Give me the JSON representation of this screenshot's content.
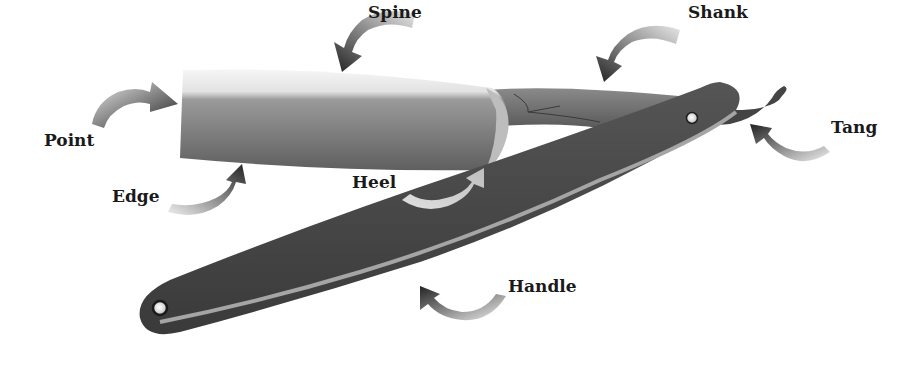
{
  "diagram": {
    "labels": [
      {
        "id": "spine",
        "text": "Spine",
        "x": 368,
        "y": 4
      },
      {
        "id": "shank",
        "text": "Shank",
        "x": 688,
        "y": 4
      },
      {
        "id": "point",
        "text": "Point",
        "x": 44,
        "y": 132
      },
      {
        "id": "tang",
        "text": "Tang",
        "x": 831,
        "y": 119
      },
      {
        "id": "edge",
        "text": "Edge",
        "x": 112,
        "y": 188
      },
      {
        "id": "heel",
        "text": "Heel",
        "x": 352,
        "y": 174
      },
      {
        "id": "handle",
        "text": "Handle",
        "x": 508,
        "y": 278
      }
    ],
    "colors": {
      "blade_light": "#f2f2f2",
      "blade_dark": "#6b6b6b",
      "handle": "#4a4a4a",
      "handle_stripe": "#9a9a9a",
      "arrow_dark": "#2a2a2a",
      "arrow_light": "#e6e6e6",
      "pin": "#f5f5f5",
      "text": "#1a1a1a"
    }
  }
}
